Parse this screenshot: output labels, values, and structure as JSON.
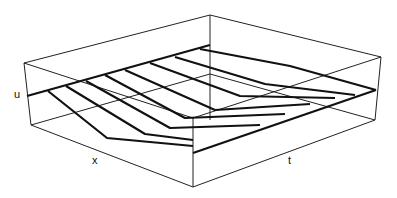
{
  "chart_data": {
    "type": "line",
    "subtype": "3d-wireframe-surface",
    "title": "",
    "xlabel": "x",
    "ylabel": "t",
    "zlabel": "u",
    "grid": false,
    "legend": null,
    "series_count": 8,
    "box": {
      "top": [
        [
          24,
          63
        ],
        [
          210,
          15
        ],
        [
          381,
          57
        ],
        [
          193,
          118
        ]
      ],
      "bottom_front": [
        [
          31,
          125
        ],
        [
          193,
          187
        ],
        [
          375,
          120
        ]
      ],
      "back_vertical": [
        [
          210,
          15
        ],
        [
          210,
          120
        ]
      ]
    },
    "edges": {
      "x0_edge": [
        [
          27,
          96
        ],
        [
          210,
          45
        ]
      ],
      "xmax_edge": [
        [
          193,
          153
        ],
        [
          376,
          90
        ]
      ]
    },
    "curves": [
      [
        [
          48,
          91
        ],
        [
          107,
          138
        ],
        [
          193,
          146
        ]
      ],
      [
        [
          66,
          86
        ],
        [
          145,
          134
        ],
        [
          193,
          140
        ]
      ],
      [
        [
          86,
          81
        ],
        [
          170,
          128
        ],
        [
          260,
          125
        ]
      ],
      [
        [
          105,
          75
        ],
        [
          185,
          118
        ],
        [
          285,
          114
        ]
      ],
      [
        [
          125,
          70
        ],
        [
          215,
          110
        ],
        [
          310,
          104
        ]
      ],
      [
        [
          150,
          63
        ],
        [
          240,
          96
        ],
        [
          335,
          98
        ]
      ],
      [
        [
          175,
          57
        ],
        [
          265,
          84
        ],
        [
          355,
          95
        ]
      ],
      [
        [
          200,
          49
        ],
        [
          290,
          66
        ],
        [
          376,
          90
        ]
      ]
    ]
  },
  "axes": {
    "u_label": "u",
    "x_label": "x",
    "t_label": "t"
  }
}
